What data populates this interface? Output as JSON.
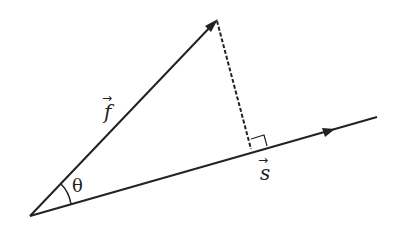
{
  "diagram": {
    "labels": {
      "force": "f",
      "displacement": "s",
      "angle": "θ",
      "vector_arrow": "→"
    },
    "colors": {
      "line": "#222222",
      "background": "#ffffff"
    },
    "elements": [
      {
        "id": "vector-f",
        "kind": "arrow",
        "from": [
          30,
          216
        ],
        "to": [
          217,
          20
        ]
      },
      {
        "id": "vector-s",
        "kind": "line-with-arrowhead",
        "from": [
          30,
          216
        ],
        "to": [
          377,
          117
        ],
        "arrowhead_at": [
          330,
          130
        ]
      },
      {
        "id": "perpendicular",
        "kind": "dashed-line",
        "from": [
          217,
          20
        ],
        "to": [
          251,
          150
        ]
      },
      {
        "id": "right-angle-marker",
        "kind": "square",
        "at": [
          251,
          150
        ]
      },
      {
        "id": "angle-arc",
        "kind": "arc",
        "center": [
          30,
          216
        ],
        "between": [
          "vector-s",
          "vector-f"
        ]
      }
    ]
  }
}
